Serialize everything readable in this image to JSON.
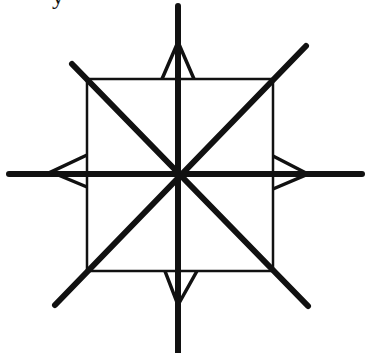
{
  "figure": {
    "stroke_color": "#111111",
    "background": "#ffffff",
    "cropped_glyph": "y",
    "square": {
      "x": 87,
      "y": 79,
      "width": 186,
      "height": 192
    },
    "center": {
      "x": 178,
      "y": 174
    },
    "thick_lines": [
      {
        "name": "vertical",
        "x1": 178,
        "y1": 6,
        "x2": 178,
        "y2": 352
      },
      {
        "name": "horizontal",
        "x1": 9,
        "y1": 174,
        "x2": 362,
        "y2": 174
      },
      {
        "name": "diagonal-down",
        "x1": 72,
        "y1": 64,
        "x2": 308,
        "y2": 306
      },
      {
        "name": "diagonal-up",
        "x1": 306,
        "y1": 46,
        "x2": 55,
        "y2": 305
      }
    ],
    "triangles": [
      {
        "name": "top",
        "points": "162,79 178,42 194,79"
      },
      {
        "name": "bottom",
        "points": "165,271 178,305 197,271"
      },
      {
        "name": "left",
        "points": "87,155 51,172 87,187"
      },
      {
        "name": "right",
        "points": "273,156 308,174 273,189"
      }
    ]
  }
}
